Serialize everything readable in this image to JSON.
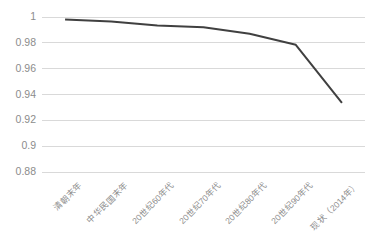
{
  "chart_data": {
    "type": "line",
    "title": "",
    "subtitle": "",
    "xlabel": "",
    "ylabel": "",
    "categories": [
      "清朝末年",
      "中华民国末年",
      "20世纪60年代",
      "20世纪70年代",
      "20世纪80年代",
      "20世纪90年代",
      "现状（2014年）"
    ],
    "values": [
      0.998,
      0.9965,
      0.9935,
      0.992,
      0.987,
      0.9785,
      0.9335
    ],
    "series": [
      {
        "name": "",
        "values": [
          0.998,
          0.9965,
          0.9935,
          0.992,
          0.987,
          0.9785,
          0.9335
        ],
        "color": "#404040"
      }
    ],
    "ylim": [
      0.88,
      1.0
    ],
    "ytick_labels": [
      "1",
      "0.98",
      "0.96",
      "0.94",
      "0.92",
      "0.9",
      "0.88"
    ],
    "ytick_values": [
      1.0,
      0.98,
      0.96,
      0.94,
      0.92,
      0.9,
      0.88
    ],
    "grid": true,
    "grid_axis": "y",
    "legend": "none",
    "markers": false,
    "line_width": 2,
    "colors": {
      "line": "#404040",
      "gridline": "#d9d9d9",
      "axis_text": "#8c8c8c",
      "background": "#ffffff"
    }
  }
}
